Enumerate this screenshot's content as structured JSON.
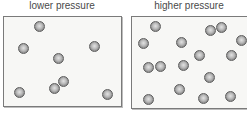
{
  "panels": [
    {
      "label": "lower pressure",
      "box": {
        "left": 3,
        "top": 16,
        "width": 118,
        "height": 90
      },
      "particles": [
        [
          39,
          26
        ],
        [
          23,
          48
        ],
        [
          94,
          46
        ],
        [
          58,
          58
        ],
        [
          63,
          81
        ],
        [
          54,
          88
        ],
        [
          19,
          92
        ],
        [
          107,
          94
        ]
      ]
    },
    {
      "label": "higher pressure",
      "box": {
        "left": 131,
        "top": 16,
        "width": 116,
        "height": 92
      },
      "particles": [
        [
          155,
          26
        ],
        [
          143,
          43
        ],
        [
          181,
          42
        ],
        [
          210,
          30
        ],
        [
          221,
          27
        ],
        [
          241,
          40
        ],
        [
          199,
          55
        ],
        [
          231,
          55
        ],
        [
          148,
          67
        ],
        [
          160,
          66
        ],
        [
          183,
          65
        ],
        [
          209,
          77
        ],
        [
          179,
          89
        ],
        [
          148,
          99
        ],
        [
          203,
          98
        ],
        [
          230,
          96
        ]
      ]
    }
  ]
}
